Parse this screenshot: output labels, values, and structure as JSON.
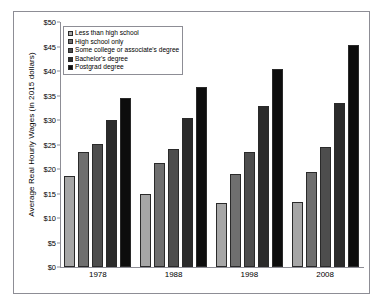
{
  "chart_data": {
    "type": "bar",
    "title": "",
    "subtitle": "",
    "xlabel": "",
    "ylabel": "Average Real Hourly Wages (in 2015 dollars)",
    "categories": [
      "1978",
      "1988",
      "1998",
      "2008"
    ],
    "series": [
      {
        "name": "Less than high school",
        "color": "#a6a6a6",
        "values": [
          18.5,
          14.9,
          13.1,
          13.3
        ]
      },
      {
        "name": "High school only",
        "color": "#6f6f6f",
        "values": [
          23.5,
          21.3,
          19.0,
          19.3
        ]
      },
      {
        "name": "Some college or associate's degree",
        "color": "#4d4d4d",
        "values": [
          25.2,
          24.1,
          23.5,
          24.5
        ]
      },
      {
        "name": "Bachelor's degree",
        "color": "#2b2b2b",
        "values": [
          30.1,
          30.4,
          32.9,
          33.4
        ]
      },
      {
        "name": "Postgrad degree",
        "color": "#0d0d0d",
        "values": [
          34.5,
          36.7,
          40.5,
          45.4
        ]
      }
    ],
    "ylim": [
      0,
      50
    ],
    "yticks": [
      0,
      5,
      10,
      15,
      20,
      25,
      30,
      35,
      40,
      45,
      50
    ],
    "ytick_labels": [
      "$0",
      "$5",
      "$10",
      "$15",
      "$20",
      "$25",
      "$30",
      "$35",
      "$40",
      "$45",
      "$50"
    ],
    "grid": false,
    "legend_position": "upper-left",
    "frame": true
  }
}
